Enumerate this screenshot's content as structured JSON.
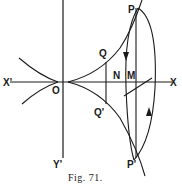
{
  "figure": {
    "caption": "Fig. 71.",
    "labels": {
      "P": "P",
      "P_prime": "P'",
      "Q": "Q",
      "Q_prime": "Q'",
      "N": "N",
      "M": "M",
      "X": "X",
      "X_prime": "X'",
      "O": "O",
      "Y_prime": "Y'"
    },
    "colors": {
      "ink": "#1a1a1a",
      "paper": "#ffffff"
    }
  }
}
